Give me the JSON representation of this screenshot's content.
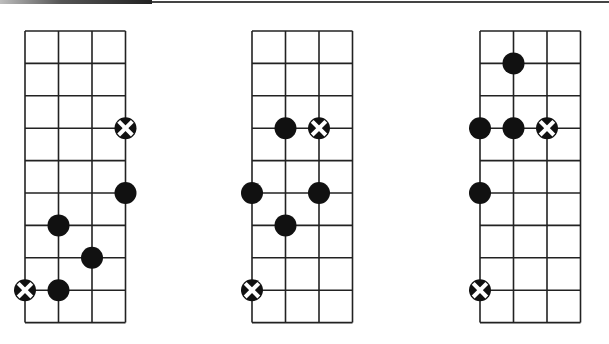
{
  "header": {
    "rule_color": "#444444"
  },
  "grid": {
    "strings": 4,
    "fret_lines": 10,
    "col_spacing": 33.5,
    "row_spacing": 32.4,
    "top_y": 31,
    "line_color": "#222222",
    "dot_color": "#111111",
    "marker_radius": 11
  },
  "diagrams": [
    {
      "id": "diagram-1",
      "left_x": 25,
      "markers": [
        {
          "type": "root",
          "string": 3,
          "fret_line": 3
        },
        {
          "type": "dot",
          "string": 3,
          "fret_line": 5
        },
        {
          "type": "dot",
          "string": 1,
          "fret_line": 6
        },
        {
          "type": "dot",
          "string": 2,
          "fret_line": 7
        },
        {
          "type": "root",
          "string": 0,
          "fret_line": 8
        },
        {
          "type": "dot",
          "string": 1,
          "fret_line": 8
        }
      ]
    },
    {
      "id": "diagram-2",
      "left_x": 252,
      "markers": [
        {
          "type": "dot",
          "string": 1,
          "fret_line": 3
        },
        {
          "type": "root",
          "string": 2,
          "fret_line": 3
        },
        {
          "type": "dot",
          "string": 0,
          "fret_line": 5
        },
        {
          "type": "dot",
          "string": 2,
          "fret_line": 5
        },
        {
          "type": "dot",
          "string": 1,
          "fret_line": 6
        },
        {
          "type": "root",
          "string": 0,
          "fret_line": 8
        }
      ]
    },
    {
      "id": "diagram-3",
      "left_x": 480,
      "markers": [
        {
          "type": "dot",
          "string": 1,
          "fret_line": 1
        },
        {
          "type": "dot",
          "string": 0,
          "fret_line": 3
        },
        {
          "type": "dot",
          "string": 1,
          "fret_line": 3
        },
        {
          "type": "root",
          "string": 2,
          "fret_line": 3
        },
        {
          "type": "dot",
          "string": 0,
          "fret_line": 5
        },
        {
          "type": "root",
          "string": 0,
          "fret_line": 8
        }
      ]
    }
  ],
  "legend": {
    "dot": "filled-circle-icon (scale note)",
    "root": "x-circle-icon (root note)"
  }
}
